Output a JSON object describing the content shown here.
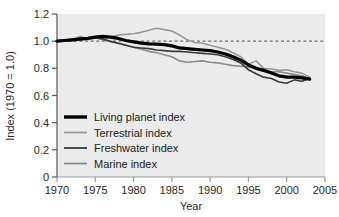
{
  "chart_data": {
    "type": "line",
    "title": "",
    "xlabel": "Year",
    "ylabel": "Index (1970 = 1.0)",
    "xlim": [
      1970,
      2005
    ],
    "ylim": [
      0,
      1.2
    ],
    "xticks": [
      1970,
      1975,
      1980,
      1985,
      1990,
      1995,
      2000,
      2005
    ],
    "yticks": [
      0,
      0.2,
      0.4,
      0.6,
      0.8,
      1.0,
      1.2
    ],
    "ytick_labels": [
      "0",
      "0.2",
      "0.4",
      "0.6",
      "0.8",
      "1.0",
      "1.2"
    ],
    "xtick_labels": [
      "1970",
      "1975",
      "1980",
      "1985",
      "1990",
      "1995",
      "2000",
      "2005"
    ],
    "grid": false,
    "plot_background": "#ebebeb",
    "legend_position": "lower-left-inside",
    "reference_line": {
      "label": "1.0 baseline",
      "value": 1.0,
      "style": "dashed",
      "color": "#6e6e6e"
    },
    "x": [
      1970,
      1971,
      1972,
      1973,
      1974,
      1975,
      1976,
      1977,
      1978,
      1979,
      1980,
      1981,
      1982,
      1983,
      1984,
      1985,
      1986,
      1987,
      1988,
      1989,
      1990,
      1991,
      1992,
      1993,
      1994,
      1995,
      1996,
      1997,
      1998,
      1999,
      2000,
      2001,
      2002,
      2003
    ],
    "series": [
      {
        "name": "Living planet index",
        "color": "#000000",
        "width": 3.2,
        "values": [
          1.0,
          1.005,
          1.01,
          1.015,
          1.02,
          1.03,
          1.035,
          1.03,
          1.02,
          1.005,
          0.995,
          0.985,
          0.98,
          0.978,
          0.975,
          0.965,
          0.95,
          0.945,
          0.94,
          0.935,
          0.93,
          0.92,
          0.905,
          0.885,
          0.86,
          0.825,
          0.8,
          0.785,
          0.765,
          0.745,
          0.735,
          0.735,
          0.73,
          0.72
        ]
      },
      {
        "name": "Terrestrial index",
        "color": "#9a9a9a",
        "width": 1.6,
        "values": [
          1.005,
          1.01,
          1.015,
          1.035,
          1.02,
          1.03,
          1.015,
          1.03,
          1.045,
          1.05,
          1.055,
          1.065,
          1.08,
          1.095,
          1.085,
          1.075,
          1.045,
          1.01,
          0.99,
          0.985,
          0.97,
          0.955,
          0.94,
          0.915,
          0.885,
          0.83,
          0.855,
          0.8,
          0.795,
          0.785,
          0.79,
          0.775,
          0.765,
          0.735
        ]
      },
      {
        "name": "Freshwater index",
        "color": "#3a3a3a",
        "width": 1.6,
        "values": [
          1.0,
          1.005,
          1.01,
          1.025,
          1.02,
          1.03,
          1.015,
          1.0,
          0.985,
          0.97,
          0.955,
          0.95,
          0.945,
          0.935,
          0.93,
          0.925,
          0.925,
          0.92,
          0.915,
          0.91,
          0.905,
          0.9,
          0.885,
          0.865,
          0.84,
          0.79,
          0.76,
          0.735,
          0.725,
          0.7,
          0.69,
          0.715,
          0.705,
          0.725
        ]
      },
      {
        "name": "Marine index",
        "color": "#8c8c8c",
        "width": 1.6,
        "values": [
          1.0,
          1.005,
          1.005,
          1.02,
          1.01,
          1.025,
          1.01,
          0.995,
          0.985,
          0.97,
          0.955,
          0.94,
          0.925,
          0.915,
          0.9,
          0.885,
          0.855,
          0.845,
          0.85,
          0.855,
          0.845,
          0.84,
          0.83,
          0.82,
          0.815,
          0.81,
          0.8,
          0.785,
          0.775,
          0.775,
          0.765,
          0.755,
          0.745,
          0.725
        ]
      }
    ]
  },
  "legend": {
    "items": [
      {
        "label": "Living planet index",
        "color": "#000000",
        "width": 3.4
      },
      {
        "label": "Terrestrial index",
        "color": "#9a9a9a",
        "width": 1.8
      },
      {
        "label": "Freshwater index",
        "color": "#3a3a3a",
        "width": 1.8
      },
      {
        "label": "Marine index",
        "color": "#8c8c8c",
        "width": 1.8
      }
    ]
  }
}
